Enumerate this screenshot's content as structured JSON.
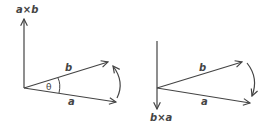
{
  "diagram": {
    "stroke_color": "#444444",
    "left": {
      "up_label": "a×b",
      "vector_b_label": "b",
      "vector_a_label": "a",
      "angle_label": "θ",
      "rotation": "a to b (counterclockwise)"
    },
    "right": {
      "down_label": "b×a",
      "vector_b_label": "b",
      "vector_a_label": "a",
      "rotation": "b to a (clockwise)"
    }
  }
}
